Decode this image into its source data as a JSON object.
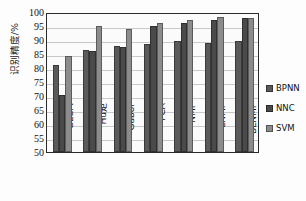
{
  "chart_data": {
    "type": "bar",
    "title": "",
    "xlabel": "",
    "ylabel": "识别精度/%",
    "ylim": [
      50,
      100
    ],
    "ytick_step": 5,
    "grid": true,
    "legend_position": "right",
    "categories": [
      "GLCM",
      "Hu矩",
      "Gabor",
      "PCA",
      "NMF",
      "LNMF",
      "BLNMF"
    ],
    "yticks": [
      "100",
      "95",
      "90",
      "85",
      "80",
      "75",
      "70",
      "65",
      "60",
      "55",
      "50"
    ],
    "series": [
      {
        "name": "BPNN",
        "color": "#5a5a5a",
        "values": [
          81.2,
          86.5,
          87.8,
          88.5,
          89.5,
          89.0,
          89.7
        ]
      },
      {
        "name": "NNC",
        "color": "#4a4a4a",
        "values": [
          70.5,
          86.2,
          87.5,
          95.0,
          96.2,
          97.3,
          97.8
        ]
      },
      {
        "name": "SVM",
        "color": "#8c8c8c",
        "values": [
          84.2,
          95.0,
          94.0,
          96.2,
          97.3,
          98.2,
          97.8
        ]
      }
    ]
  },
  "legend": {
    "items": [
      {
        "label": "BPNN",
        "color": "#5a5a5a"
      },
      {
        "label": "NNC",
        "color": "#4a4a4a"
      },
      {
        "label": "SVM",
        "color": "#8c8c8c"
      }
    ]
  },
  "axes": {
    "y_title": "识别精度/%"
  }
}
